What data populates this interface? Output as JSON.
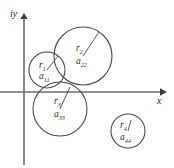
{
  "figure": {
    "background_color": "#ffffff",
    "stroke_color": "#4a4a4a",
    "axis_color": "#6b6b6b",
    "text_color": "#2b2b2b"
  },
  "axes": {
    "y_axis_label": "iy",
    "x_axis_label": "x",
    "origin": {
      "x": 24,
      "y": 92
    },
    "x_axis": {
      "x1": 0,
      "y1": 92,
      "x2": 163,
      "y2": 92,
      "arrow": "right"
    },
    "y_axis": {
      "x1": 24,
      "y1": 165,
      "x2": 24,
      "y2": 16,
      "arrow": "up"
    }
  },
  "discs": [
    {
      "id": "disc-1",
      "radius_label": "r",
      "radius_subscript": "1",
      "center_label": "a",
      "center_subscript": "11",
      "cx": 47,
      "cy": 70,
      "r": 18,
      "radius_line": {
        "x1": 47,
        "y1": 70,
        "x2": 58,
        "y2": 56
      },
      "radius_text_pos": {
        "x": 39,
        "y": 67
      },
      "center_text_pos": {
        "x": 39,
        "y": 78
      }
    },
    {
      "id": "disc-2",
      "radius_label": "r",
      "radius_subscript": "2",
      "center_label": "a",
      "center_subscript": "22",
      "cx": 83,
      "cy": 56,
      "r": 29,
      "radius_line": {
        "x1": 83,
        "y1": 56,
        "x2": 99,
        "y2": 32
      },
      "radius_text_pos": {
        "x": 76,
        "y": 50
      },
      "center_text_pos": {
        "x": 76,
        "y": 63
      }
    },
    {
      "id": "disc-3",
      "radius_label": "r",
      "radius_subscript": "3",
      "center_label": "a",
      "center_subscript": "33",
      "cx": 60,
      "cy": 109,
      "r": 27,
      "radius_line": {
        "x1": 60,
        "y1": 109,
        "x2": 70,
        "y2": 87
      },
      "radius_text_pos": {
        "x": 54,
        "y": 103
      },
      "center_text_pos": {
        "x": 54,
        "y": 116
      }
    },
    {
      "id": "disc-4",
      "radius_label": "r",
      "radius_subscript": "4",
      "center_label": "a",
      "center_subscript": "44",
      "cx": 128,
      "cy": 131,
      "r": 17,
      "radius_line": {
        "x1": 128,
        "y1": 131,
        "x2": 131,
        "y2": 120
      },
      "radius_text_pos": {
        "x": 120,
        "y": 127
      },
      "center_text_pos": {
        "x": 120,
        "y": 139
      }
    }
  ]
}
